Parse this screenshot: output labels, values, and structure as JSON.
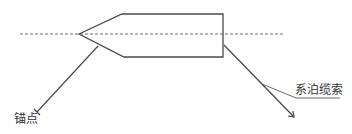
{
  "labels": {
    "anchor_point": "锚点",
    "mooring_line": "系泊缆索"
  },
  "colors": {
    "line": "#4a4a4a",
    "dashed": "#6f6f6f",
    "text": "#333333",
    "background": "#ffffff"
  },
  "geometry": {
    "hull_points": "79,34 122,14 223,14 223,57 124,57",
    "centerline": {
      "x1": 20,
      "y1": 34,
      "x2": 285,
      "y2": 34
    },
    "anchor_line": {
      "x1": 98,
      "y1": 46,
      "x2": 37,
      "y2": 112
    },
    "mooring_line": {
      "x1": 224,
      "y1": 45,
      "x2": 294,
      "y2": 117
    },
    "leader_line_points": "262,84 296,98 340,98"
  }
}
